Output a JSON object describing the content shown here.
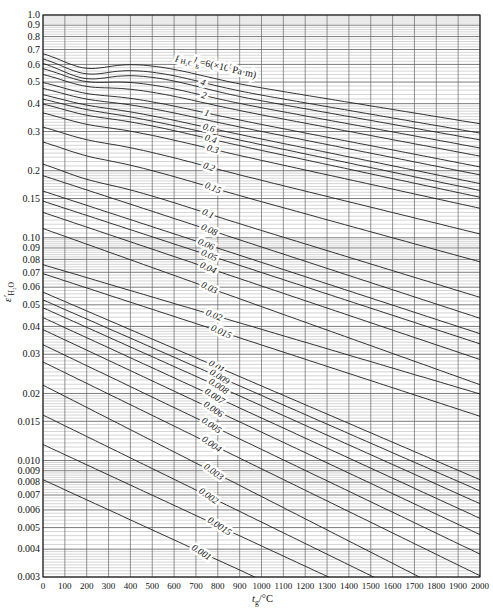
{
  "chart_data": {
    "type": "line",
    "title": "",
    "xlabel_segments": [
      {
        "text": "t",
        "italic": true
      },
      {
        "text": "g",
        "script": "sub"
      },
      {
        "text": "/°C"
      }
    ],
    "ylabel_segments": [
      {
        "text": "ε′",
        "italic": true
      },
      {
        "text": "H₂O",
        "script": "sub"
      }
    ],
    "x_range": [
      0,
      2000
    ],
    "y_range": [
      0.003,
      1.0
    ],
    "y_scale": "log",
    "grid": "on",
    "x_ticks": [
      0,
      100,
      200,
      300,
      400,
      500,
      600,
      700,
      800,
      900,
      1000,
      1100,
      1200,
      1300,
      1400,
      1500,
      1600,
      1700,
      1800,
      1900,
      2000
    ],
    "y_tick_labels": [
      "1.0",
      "0.9",
      "0.8",
      "0.7",
      "0.6",
      "0.5",
      "0.4",
      "0.3",
      "0.2",
      "0.15",
      "0.10",
      "0.09",
      "0.08",
      "0.07",
      "0.06",
      "0.05",
      "0.04",
      "0.03",
      "0.02",
      "0.015",
      "0.010",
      "0.009",
      "0.008",
      "0.007",
      "0.006",
      "0.005",
      "0.004",
      "0.003"
    ],
    "param_label": {
      "meaning": "p_H2O * l_g = 6 (×10^5 Pa·m), label of topmost curve",
      "segments": [
        {
          "text": "p",
          "italic": true
        },
        {
          "text": "H₂O",
          "script": "sub"
        },
        {
          "text": "l",
          "italic": true
        },
        {
          "text": "g",
          "script": "sub"
        },
        {
          "text": "=6(×10"
        },
        {
          "text": "5",
          "script": "sup"
        },
        {
          "text": "Pa·m)"
        }
      ],
      "t": 790,
      "rise_px": 10,
      "angle_deg": 13
    },
    "series_note": "Each curve: water-vapour emissivity vs gas temperature for constant p·l (×10^5 Pa·m). eps values read off the chart at 0°C and 2000°C (extrapolated where curve exits bottom).",
    "series": [
      {
        "pl": 6,
        "label": null,
        "eps_at_0C": 0.68,
        "eps_at_2000C": 0.325,
        "label_t": null
      },
      {
        "pl": 4,
        "label": "4",
        "eps_at_0C": 0.645,
        "eps_at_2000C": 0.295,
        "label_t": 728
      },
      {
        "pl": 3,
        "label": null,
        "eps_at_0C": 0.615,
        "eps_at_2000C": 0.275,
        "label_t": null
      },
      {
        "pl": 2,
        "label": "2",
        "eps_at_0C": 0.58,
        "eps_at_2000C": 0.253,
        "label_t": 732
      },
      {
        "pl": 1.5,
        "label": null,
        "eps_at_0C": 0.545,
        "eps_at_2000C": 0.2325,
        "label_t": null
      },
      {
        "pl": 1,
        "label": "1",
        "eps_at_0C": 0.5,
        "eps_at_2000C": 0.208,
        "label_t": 746
      },
      {
        "pl": 0.8,
        "label": null,
        "eps_at_0C": 0.47,
        "eps_at_2000C": 0.1915,
        "label_t": null
      },
      {
        "pl": 0.6,
        "label": "0.6",
        "eps_at_0C": 0.44,
        "eps_at_2000C": 0.175,
        "label_t": 755
      },
      {
        "pl": 0.5,
        "label": null,
        "eps_at_0C": 0.42,
        "eps_at_2000C": 0.163,
        "label_t": null
      },
      {
        "pl": 0.4,
        "label": "0.4",
        "eps_at_0C": 0.4,
        "eps_at_2000C": 0.152,
        "label_t": 764
      },
      {
        "pl": 0.3,
        "label": "0.3",
        "eps_at_0C": 0.365,
        "eps_at_2000C": 0.1356,
        "label_t": 773
      },
      {
        "pl": 0.2,
        "label": "0.2",
        "eps_at_0C": 0.315,
        "eps_at_2000C": 0.104,
        "label_t": 755
      },
      {
        "pl": 0.15,
        "label": "0.15",
        "eps_at_0C": 0.27,
        "eps_at_2000C": 0.078,
        "label_t": 773
      },
      {
        "pl": 0.1,
        "label": "0.1",
        "eps_at_0C": 0.215,
        "eps_at_2000C": 0.054,
        "label_t": 750
      },
      {
        "pl": 0.08,
        "label": "0.08",
        "eps_at_0C": 0.19,
        "eps_at_2000C": 0.0435,
        "label_t": 755
      },
      {
        "pl": 0.06,
        "label": "0.06",
        "eps_at_0C": 0.162,
        "eps_at_2000C": 0.0371,
        "label_t": 741
      },
      {
        "pl": 0.05,
        "label": "0.05",
        "eps_at_0C": 0.146,
        "eps_at_2000C": 0.0334,
        "label_t": 755
      },
      {
        "pl": 0.04,
        "label": "0.04",
        "eps_at_0C": 0.13,
        "eps_at_2000C": 0.0284,
        "label_t": 750
      },
      {
        "pl": 0.03,
        "label": "0.03",
        "eps_at_0C": 0.11,
        "eps_at_2000C": 0.0219,
        "label_t": 755
      },
      {
        "pl": 0.02,
        "label": "0.02",
        "eps_at_0C": 0.0757,
        "eps_at_2000C": 0.0199,
        "label_t": 778
      },
      {
        "pl": 0.015,
        "label": "0.015",
        "eps_at_0C": 0.069,
        "eps_at_2000C": 0.0158,
        "label_t": 810
      },
      {
        "pl": 0.01,
        "label": "0.01",
        "eps_at_0C": 0.057,
        "eps_at_2000C": 0.0082,
        "label_t": 787
      },
      {
        "pl": 0.009,
        "label": "0.009",
        "eps_at_0C": 0.0526,
        "eps_at_2000C": 0.0073,
        "label_t": 801
      },
      {
        "pl": 0.008,
        "label": "0.008",
        "eps_at_0C": 0.0485,
        "eps_at_2000C": 0.0064,
        "label_t": 796
      },
      {
        "pl": 0.007,
        "label": "0.007",
        "eps_at_0C": 0.0438,
        "eps_at_2000C": 0.0055,
        "label_t": 778
      },
      {
        "pl": 0.006,
        "label": "0.006",
        "eps_at_0C": 0.0387,
        "eps_at_2000C": 0.00465,
        "label_t": 773
      },
      {
        "pl": 0.005,
        "label": "0.005",
        "eps_at_0C": 0.0331,
        "eps_at_2000C": 0.0038,
        "label_t": 764
      },
      {
        "pl": 0.004,
        "label": "0.004",
        "eps_at_0C": 0.0277,
        "eps_at_2000C": 0.00304,
        "label_t": 764
      },
      {
        "pl": 0.003,
        "label": "0.003",
        "eps_at_0C": 0.0218,
        "eps_at_2000C": 0.00218,
        "label_t": 773
      },
      {
        "pl": 0.002,
        "label": "0.002",
        "eps_at_0C": 0.016,
        "eps_at_2000C": 0.00175,
        "label_t": 750
      },
      {
        "pl": 0.0015,
        "label": "0.0015",
        "eps_at_0C": 0.0118,
        "eps_at_2000C": 0.00145,
        "label_t": 801
      },
      {
        "pl": 0.001,
        "label": "0.001",
        "eps_at_0C": 0.0082,
        "eps_at_2000C": 0.00103,
        "label_t": 718
      }
    ]
  },
  "layout": {
    "plot": {
      "left": 43,
      "top": 15,
      "right": 480,
      "bottom": 577
    },
    "colors": {
      "curve": "#1c1c1c",
      "grid_minor": "#a8a8a8",
      "grid_major": "#5a5a5a",
      "grid_vertical": "#666666",
      "border": "#161616",
      "text": "#111111",
      "background": "#ffffff"
    }
  }
}
